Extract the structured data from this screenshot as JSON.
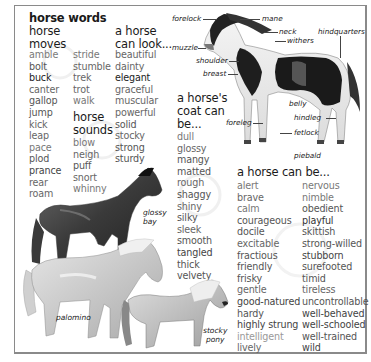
{
  "title": "horse words",
  "sections": {
    "moves": {
      "heading": [
        "horse",
        "moves"
      ],
      "col1": [
        {
          "w": "amble",
          "c": "#7a7a7a"
        },
        {
          "w": "bolt",
          "c": "#555"
        },
        {
          "w": "buck",
          "c": "#222"
        },
        {
          "w": "canter",
          "c": "#666"
        },
        {
          "w": "gallop",
          "c": "#555"
        },
        {
          "w": "jump",
          "c": "#555"
        },
        {
          "w": "kick",
          "c": "#666"
        },
        {
          "w": "leap",
          "c": "#666"
        },
        {
          "w": "pace",
          "c": "#777"
        },
        {
          "w": "plod",
          "c": "#555"
        },
        {
          "w": "prance",
          "c": "#444"
        },
        {
          "w": "rear",
          "c": "#666"
        },
        {
          "w": "roam",
          "c": "#666"
        }
      ],
      "col2": [
        {
          "w": "stride",
          "c": "#777"
        },
        {
          "w": "stumble",
          "c": "#666"
        },
        {
          "w": "trek",
          "c": "#666"
        },
        {
          "w": "trot",
          "c": "#666"
        },
        {
          "w": "walk",
          "c": "#777"
        }
      ]
    },
    "sounds": {
      "heading": [
        "horse",
        "sounds"
      ],
      "words": [
        {
          "w": "blow",
          "c": "#777"
        },
        {
          "w": "neigh",
          "c": "#666"
        },
        {
          "w": "puff",
          "c": "#555"
        },
        {
          "w": "snort",
          "c": "#666"
        },
        {
          "w": "whinny",
          "c": "#777"
        }
      ]
    },
    "look": {
      "heading": [
        "a horse",
        "can look..."
      ],
      "words": [
        {
          "w": "beautiful",
          "c": "#666"
        },
        {
          "w": "dainty",
          "c": "#666"
        },
        {
          "w": "elegant",
          "c": "#222"
        },
        {
          "w": "graceful",
          "c": "#666"
        },
        {
          "w": "muscular",
          "c": "#666"
        },
        {
          "w": "powerful",
          "c": "#666"
        },
        {
          "w": "solid",
          "c": "#555"
        },
        {
          "w": "stocky",
          "c": "#666"
        },
        {
          "w": "strong",
          "c": "#555"
        },
        {
          "w": "sturdy",
          "c": "#555"
        }
      ]
    },
    "coat": {
      "heading": [
        "a horse's",
        "coat can",
        "be..."
      ],
      "words": [
        {
          "w": "dull",
          "c": "#777"
        },
        {
          "w": "glossy",
          "c": "#666"
        },
        {
          "w": "mangy",
          "c": "#555"
        },
        {
          "w": "matted",
          "c": "#555"
        },
        {
          "w": "rough",
          "c": "#666"
        },
        {
          "w": "shaggy",
          "c": "#555"
        },
        {
          "w": "shiny",
          "c": "#666"
        },
        {
          "w": "silky",
          "c": "#555"
        },
        {
          "w": "sleek",
          "c": "#666"
        },
        {
          "w": "smooth",
          "c": "#555"
        },
        {
          "w": "tangled",
          "c": "#444"
        },
        {
          "w": "thick",
          "c": "#555"
        },
        {
          "w": "velvety",
          "c": "#555"
        }
      ]
    },
    "canbe": {
      "heading": "a horse can be...",
      "col1": [
        {
          "w": "alert",
          "c": "#777"
        },
        {
          "w": "brave",
          "c": "#666"
        },
        {
          "w": "calm",
          "c": "#777"
        },
        {
          "w": "courageous",
          "c": "#555"
        },
        {
          "w": "docile",
          "c": "#555"
        },
        {
          "w": "excitable",
          "c": "#666"
        },
        {
          "w": "fractious",
          "c": "#555"
        },
        {
          "w": "friendly",
          "c": "#555"
        },
        {
          "w": "frisky",
          "c": "#555"
        },
        {
          "w": "gentle",
          "c": "#666"
        },
        {
          "w": "good-natured",
          "c": "#444"
        },
        {
          "w": "hardy",
          "c": "#555"
        },
        {
          "w": "highly strung",
          "c": "#444"
        },
        {
          "w": "intelligent",
          "c": "#999"
        },
        {
          "w": "lively",
          "c": "#666"
        }
      ],
      "col2": [
        {
          "w": "nervous",
          "c": "#777"
        },
        {
          "w": "nimble",
          "c": "#777"
        },
        {
          "w": "obedient",
          "c": "#555"
        },
        {
          "w": "playful",
          "c": "#333"
        },
        {
          "w": "skittish",
          "c": "#555"
        },
        {
          "w": "strong-willed",
          "c": "#555"
        },
        {
          "w": "stubborn",
          "c": "#444"
        },
        {
          "w": "surefooted",
          "c": "#555"
        },
        {
          "w": "timid",
          "c": "#555"
        },
        {
          "w": "tireless",
          "c": "#666"
        },
        {
          "w": "uncontrollable",
          "c": "#555"
        },
        {
          "w": "well-behaved",
          "c": "#444"
        },
        {
          "w": "well-schooled",
          "c": "#444"
        },
        {
          "w": "well-trained",
          "c": "#555"
        },
        {
          "w": "wild",
          "c": "#444"
        }
      ]
    }
  },
  "anatomy_labels": {
    "forelock": "forelock",
    "mane": "mane",
    "neck": "neck",
    "withers": "withers",
    "hindquarters": "hindquarters",
    "muzzle": "muzzle",
    "shoulder": "shoulder",
    "breast": "breast",
    "belly": "belly",
    "hindleg": "hindleg",
    "foreleg": "foreleg",
    "fetlock": "fetlock",
    "piebald": "piebald"
  },
  "captions": {
    "glossy_bay": [
      "glossy",
      "bay"
    ],
    "palomino": "palomino",
    "stocky_pony": [
      "stocky",
      "pony"
    ]
  }
}
